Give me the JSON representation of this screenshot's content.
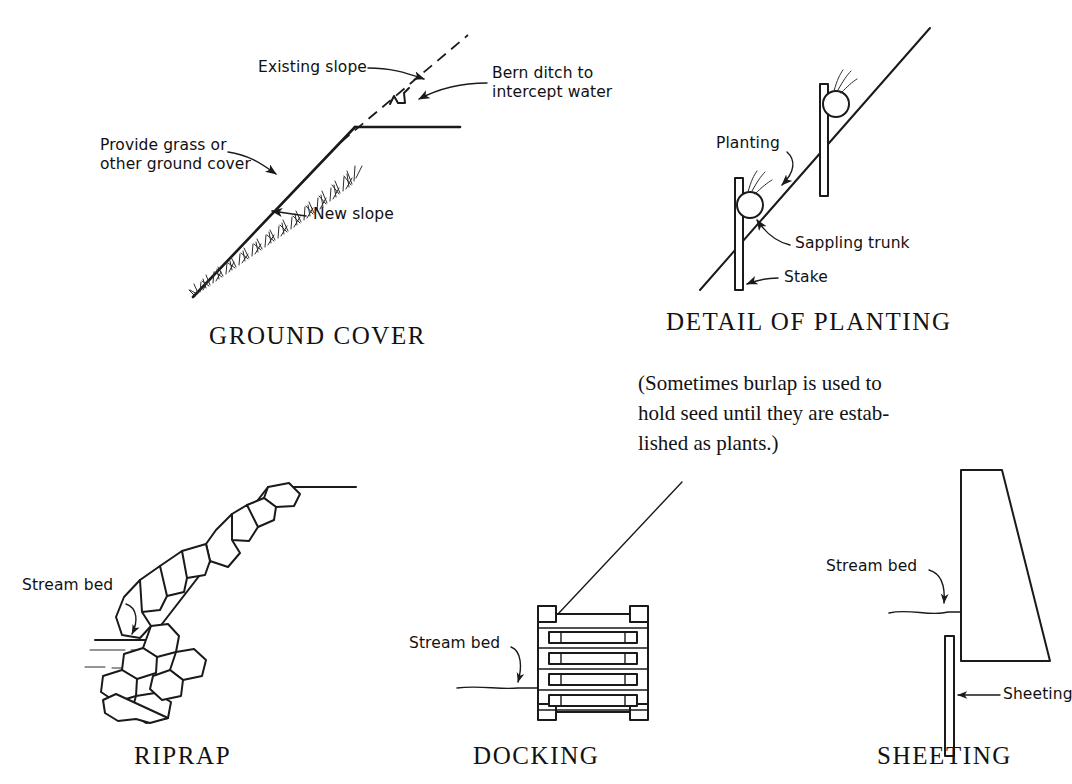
{
  "page": {
    "background_color": "#ffffff",
    "ink_color": "#1a1a1a"
  },
  "figures": [
    {
      "id": "ground-cover",
      "caption": "GROUND COVER",
      "labels": {
        "existing_slope": "Existing slope",
        "berm_ditch": "Bern ditch to\nintercept water",
        "ground_cover": "Provide grass or\nother ground cover",
        "new_slope": "New slope"
      }
    },
    {
      "id": "detail-of-planting",
      "caption": "DETAIL OF PLANTING",
      "note": "(Sometimes burlap is used to\nhold seed until they are estab-\nlished as plants.)",
      "labels": {
        "planting": "Planting",
        "sapling_trunk": "Sappling trunk",
        "stake": "Stake"
      }
    },
    {
      "id": "riprap",
      "caption": "RIPRAP",
      "labels": {
        "stream_bed": "Stream bed"
      }
    },
    {
      "id": "docking",
      "caption": "DOCKING",
      "labels": {
        "stream_bed": "Stream bed"
      }
    },
    {
      "id": "sheeting",
      "caption": "SHEETING",
      "labels": {
        "stream_bed": "Stream bed",
        "sheeting": "Sheeting"
      }
    }
  ]
}
